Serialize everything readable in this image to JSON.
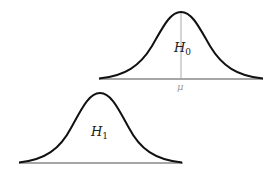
{
  "diagram": {
    "top_curve": {
      "label": "H",
      "label_subscript": "0",
      "mean_label": "μ",
      "color": "#111111",
      "baseline_color": "#888888",
      "mean_line_color": "#999999"
    },
    "bottom_curve": {
      "label": "H",
      "label_subscript": "1",
      "color": "#111111",
      "baseline_color": "#888888"
    }
  }
}
